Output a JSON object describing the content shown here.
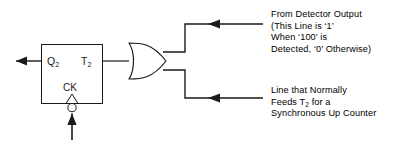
{
  "diagram": {
    "background_color": "#ffffff",
    "line_color": "#1a1a1a",
    "flipflop": {
      "output_label": "Q",
      "output_label_sub": "2",
      "input_label": "T",
      "input_label_sub": "2",
      "clock_label": "CK"
    },
    "gate": {
      "type": "or-gate",
      "name": "OR"
    },
    "annotations": {
      "detector": {
        "line1": "From Detector Output",
        "line2": "(This Line is ‘1’",
        "line3": "When ‘100’ is",
        "line4": "Detected, ‘0’ Otherwise)"
      },
      "counter": {
        "line1": "Line that Normally",
        "line2_pre": "Feeds T",
        "line2_sub": "2",
        "line2_post": " for a",
        "line3": "Synchronous Up Counter"
      }
    }
  }
}
